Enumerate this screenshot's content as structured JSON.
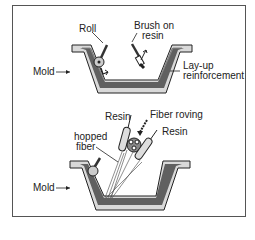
{
  "top_panel": {
    "labels": {
      "roll": "Roll",
      "brush_line1": "Brush on",
      "brush_line2": "resin",
      "mold": "Mold",
      "layup_line1": "Lay-up",
      "layup_line2": "reinforcement"
    }
  },
  "bottom_panel": {
    "labels": {
      "resin_left": "Resin",
      "fiber_roving": "Fiber roving",
      "resin_right": "Resin",
      "chopped_line1": "hopped",
      "chopped_line2": "fiber",
      "mold": "Mold"
    }
  },
  "colors": {
    "mold_fill": "#d9d9d9",
    "layer_fill": "#4a4a4a",
    "outline": "#222222",
    "frame": "#555555"
  }
}
